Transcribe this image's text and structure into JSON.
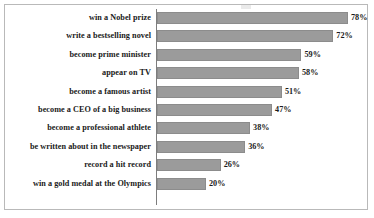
{
  "chart_data": {
    "type": "bar",
    "orientation": "horizontal",
    "title": "",
    "xlabel": "",
    "ylabel": "",
    "xlim": [
      0,
      80
    ],
    "grid": false,
    "legend": null,
    "value_suffix": "%",
    "categories": [
      "win a Nobel prize",
      "write a bestselling novel",
      "become prime minister",
      "appear on TV",
      "become a famous artist",
      "become a CEO of a big business",
      "become a professional athlete",
      "be written about in the newspaper",
      "record a hit record",
      "win a gold medal at the Olympics"
    ],
    "values": [
      78,
      72,
      59,
      58,
      51,
      47,
      38,
      36,
      26,
      20
    ],
    "value_labels": [
      "78%",
      "72%",
      "59%",
      "58%",
      "51%",
      "47%",
      "38%",
      "36%",
      "26%",
      "20%"
    ],
    "colors": {
      "bar_fill": "#9b9b9b",
      "bar_edge": "#8c8c8c",
      "axis_line": "#7d7d7d",
      "frame_border": "#b9b9b9",
      "text": "#1a1a1a",
      "background": "#ffffff"
    }
  }
}
